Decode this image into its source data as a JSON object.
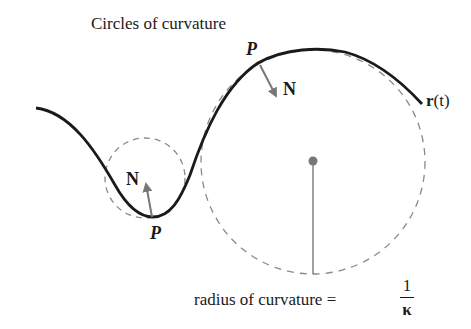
{
  "title": "Circles of curvature",
  "labels": {
    "point_top": "P",
    "point_bottom": "P",
    "normal_top": "N",
    "normal_bottom": "N",
    "curve_name_bold": "r",
    "curve_name_arg": "(t)",
    "radius_text": "radius of curvature =",
    "fraction_numerator": "1",
    "fraction_denominator": "κ"
  },
  "colors": {
    "curve": "#1a1a1a",
    "circle": "#8a8a8a",
    "vector": "#777777",
    "center_dot": "#777777"
  }
}
